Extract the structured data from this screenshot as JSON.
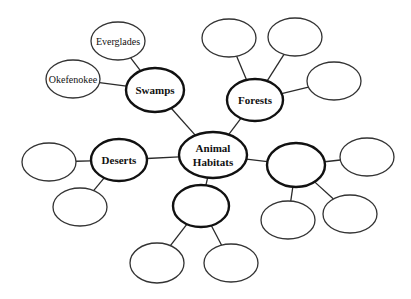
{
  "center": {
    "id": "center",
    "label_lines": [
      "Animal",
      "Habitats"
    ],
    "cx": 213,
    "cy": 155,
    "rx": 34,
    "ry": 23
  },
  "categories": [
    {
      "id": "swamps",
      "label": "Swamps",
      "cx": 155,
      "cy": 90,
      "rx": 29,
      "ry": 22,
      "children": [
        {
          "label": "Everglades",
          "cx": 118,
          "cy": 41,
          "rx": 27,
          "ry": 19
        },
        {
          "label": "Okefenokee",
          "cx": 73,
          "cy": 79,
          "rx": 27,
          "ry": 19
        }
      ]
    },
    {
      "id": "forests",
      "label": "Forests",
      "cx": 255,
      "cy": 100,
      "rx": 28,
      "ry": 21,
      "children": [
        {
          "label": "",
          "cx": 229,
          "cy": 38,
          "rx": 27,
          "ry": 19
        },
        {
          "label": "",
          "cx": 295,
          "cy": 37,
          "rx": 27,
          "ry": 19
        },
        {
          "label": "",
          "cx": 334,
          "cy": 81,
          "rx": 27,
          "ry": 19
        }
      ]
    },
    {
      "id": "deserts",
      "label": "Deserts",
      "cx": 119,
      "cy": 160,
      "rx": 28,
      "ry": 21,
      "children": [
        {
          "label": "",
          "cx": 49,
          "cy": 162,
          "rx": 27,
          "ry": 19
        },
        {
          "label": "",
          "cx": 80,
          "cy": 207,
          "rx": 27,
          "ry": 19
        }
      ]
    },
    {
      "id": "blank-bottom",
      "label": "",
      "cx": 201,
      "cy": 206,
      "rx": 28,
      "ry": 21,
      "children": [
        {
          "label": "",
          "cx": 157,
          "cy": 263,
          "rx": 27,
          "ry": 20
        },
        {
          "label": "",
          "cx": 231,
          "cy": 263,
          "rx": 27,
          "ry": 19
        }
      ]
    },
    {
      "id": "blank-right",
      "label": "",
      "cx": 296,
      "cy": 165,
      "rx": 29,
      "ry": 22,
      "children": [
        {
          "label": "",
          "cx": 367,
          "cy": 157,
          "rx": 27,
          "ry": 19
        },
        {
          "label": "",
          "cx": 288,
          "cy": 220,
          "rx": 27,
          "ry": 19
        },
        {
          "label": "",
          "cx": 350,
          "cy": 214,
          "rx": 27,
          "ry": 19
        }
      ]
    }
  ],
  "colors": {
    "stroke": "#111111",
    "background": "#ffffff"
  }
}
